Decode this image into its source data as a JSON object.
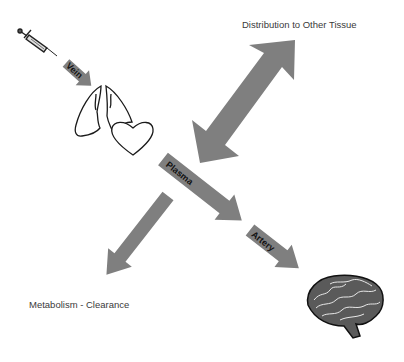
{
  "diagram": {
    "title": "",
    "labels": {
      "distribution": "Distribution to Other Tissue",
      "metabolism": "Metabolism - Clearance"
    },
    "arrows": {
      "vein": "Vein",
      "plasma": "Plasma",
      "artery": "Artery"
    },
    "icons": [
      "syringe-icon",
      "lungs-icon",
      "heart-icon",
      "brain-icon"
    ],
    "colors": {
      "arrow_fill": "#7f7f7f",
      "line": "#1a1a1a",
      "text": "#3a3a3a"
    }
  }
}
